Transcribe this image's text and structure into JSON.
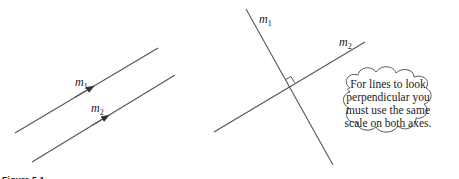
{
  "figure": {
    "caption": "Figure 5.1"
  },
  "left_diagram": {
    "title": "parallel lines",
    "lines": [
      {
        "label": "m",
        "subscript": "1",
        "x1": 15,
        "y1": 133,
        "x2": 158,
        "y2": 48
      },
      {
        "label": "m",
        "subscript": "2",
        "x1": 32,
        "y1": 162,
        "x2": 175,
        "y2": 75
      }
    ]
  },
  "right_diagram": {
    "title": "perpendicular lines",
    "lines": [
      {
        "label": "m",
        "subscript": "1",
        "x1": 246,
        "y1": 9,
        "x2": 333,
        "y2": 165
      },
      {
        "label": "m",
        "subscript": "2",
        "x1": 214,
        "y1": 132,
        "x2": 365,
        "y2": 42
      }
    ],
    "right_angle_marker": true
  },
  "callout": {
    "lines": [
      "For lines to look",
      "perpendicular you",
      "must use the same",
      "scale on both axes."
    ]
  },
  "colors": {
    "line": "#555555",
    "text": "#222222",
    "background": "#ffffff"
  }
}
